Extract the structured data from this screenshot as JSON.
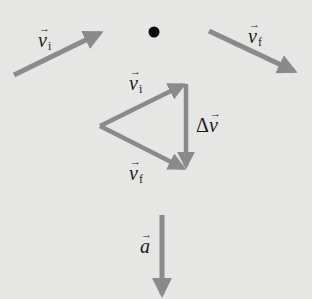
{
  "diagram": {
    "colors": {
      "background": "#e6e6e4",
      "arrow": "#8a8a8a",
      "dot": "#0a0a0a",
      "text": "#1a1a1a"
    },
    "top_row": {
      "v_initial": {
        "symbol": "v",
        "subscript": "i"
      },
      "center_dot": "point",
      "v_final": {
        "symbol": "v",
        "subscript": "f"
      }
    },
    "triangle": {
      "v_initial": {
        "symbol": "v",
        "subscript": "i"
      },
      "v_final": {
        "symbol": "v",
        "subscript": "f"
      },
      "delta_v": {
        "delta": "Δ",
        "symbol": "v"
      }
    },
    "acceleration": {
      "symbol": "a"
    }
  }
}
